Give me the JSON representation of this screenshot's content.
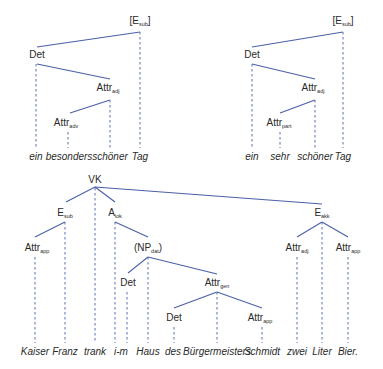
{
  "colors": {
    "edge": "#4a5fa8",
    "projection": "#5a6fb8",
    "text": "#2a2a2a",
    "background": "#ffffff"
  },
  "trees": [
    {
      "id": "tree-top-left",
      "nodes": [
        {
          "id": "esub",
          "label": "[E",
          "sub": "sub",
          "suffix": "]",
          "x": 140,
          "y": 24
        },
        {
          "id": "det",
          "label": "Det",
          "sub": "",
          "suffix": "",
          "x": 37,
          "y": 58
        },
        {
          "id": "attradj",
          "label": "Attr",
          "sub": "adj",
          "suffix": "",
          "x": 108,
          "y": 91
        },
        {
          "id": "attradv",
          "label": "Attr",
          "sub": "adv",
          "suffix": "",
          "x": 66,
          "y": 126
        }
      ],
      "words": [
        {
          "text": "ein",
          "x": 36
        },
        {
          "text": "besonders",
          "x": 69
        },
        {
          "text": "schöner",
          "x": 110
        },
        {
          "text": "Tag",
          "x": 140
        }
      ],
      "word_y": 160
    },
    {
      "id": "tree-top-right",
      "nodes": [
        {
          "id": "esub",
          "label": "[E",
          "sub": "sub",
          "suffix": "]",
          "x": 343,
          "y": 24
        },
        {
          "id": "det",
          "label": "Det",
          "sub": "",
          "suffix": "",
          "x": 252,
          "y": 58
        },
        {
          "id": "attradj",
          "label": "Attr",
          "sub": "adj",
          "suffix": "",
          "x": 313,
          "y": 91
        },
        {
          "id": "attrpart",
          "label": "Attr",
          "sub": "part",
          "suffix": "",
          "x": 279,
          "y": 126
        }
      ],
      "words": [
        {
          "text": "ein",
          "x": 252
        },
        {
          "text": "sehr",
          "x": 280
        },
        {
          "text": "schöner",
          "x": 315
        },
        {
          "text": "Tag",
          "x": 343
        }
      ],
      "word_y": 160
    },
    {
      "id": "tree-bottom",
      "nodes": [
        {
          "id": "vk",
          "label": "VK",
          "sub": "",
          "suffix": "",
          "x": 95,
          "y": 183
        },
        {
          "id": "esub",
          "label": "E",
          "sub": "sub",
          "suffix": "",
          "x": 65,
          "y": 216
        },
        {
          "id": "alok",
          "label": "A",
          "sub": "lok",
          "suffix": "",
          "x": 115,
          "y": 216
        },
        {
          "id": "attrapp1",
          "label": "Attr",
          "sub": "app",
          "suffix": "",
          "x": 37,
          "y": 251
        },
        {
          "id": "npdat",
          "label": "(NP",
          "sub": "dat",
          "suffix": ")",
          "x": 148,
          "y": 251
        },
        {
          "id": "det1",
          "label": "Det",
          "sub": "",
          "suffix": "",
          "x": 128,
          "y": 286
        },
        {
          "id": "attrgen",
          "label": "Attr",
          "sub": "gen",
          "suffix": "",
          "x": 217,
          "y": 286
        },
        {
          "id": "det2",
          "label": "Det",
          "sub": "",
          "suffix": "",
          "x": 174,
          "y": 321
        },
        {
          "id": "attrapp2",
          "label": "Attr",
          "sub": "app",
          "suffix": "",
          "x": 260,
          "y": 321
        },
        {
          "id": "eakk",
          "label": "E",
          "sub": "akk",
          "suffix": "",
          "x": 322,
          "y": 216
        },
        {
          "id": "attradj",
          "label": "Attr",
          "sub": "adj",
          "suffix": "",
          "x": 297,
          "y": 251
        },
        {
          "id": "attrapp3",
          "label": "Attr",
          "sub": "app",
          "suffix": "",
          "x": 348,
          "y": 251
        }
      ],
      "words": [
        {
          "text": "Kaiser",
          "x": 35
        },
        {
          "text": "Franz",
          "x": 65
        },
        {
          "text": "trank",
          "x": 95
        },
        {
          "text": "i-m",
          "x": 123
        },
        {
          "text": "Haus",
          "x": 148
        },
        {
          "text": "des",
          "x": 173
        },
        {
          "text": "Bürgermeisters",
          "x": 217
        },
        {
          "text": "Schmidt",
          "x": 262
        },
        {
          "text": "zwei",
          "x": 297
        },
        {
          "text": "Liter",
          "x": 322
        },
        {
          "text": "Bier.",
          "x": 348
        }
      ],
      "word_y": 355
    }
  ]
}
